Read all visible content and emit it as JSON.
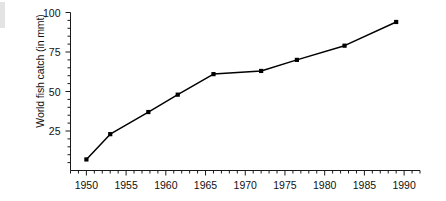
{
  "chart_data": {
    "type": "line",
    "title": "",
    "xlabel": "",
    "ylabel": "World fish catch (in mmt)",
    "xlim": [
      1948,
      1992
    ],
    "ylim": [
      0,
      100
    ],
    "grid": false,
    "legend": null,
    "x_major_ticks": [
      1950,
      1955,
      1960,
      1965,
      1970,
      1975,
      1980,
      1985,
      1990
    ],
    "x_tick_labels": [
      "1950",
      "1955",
      "1960",
      "1965",
      "1970",
      "1975",
      "1980",
      "1985",
      "1990"
    ],
    "x_minor_tick_interval": 1,
    "y_major_ticks": [
      25,
      50,
      75,
      100
    ],
    "y_tick_labels": [
      "25",
      "50",
      "75",
      "100"
    ],
    "y_minor_tick_interval": 5,
    "marker": "square",
    "marker_color": "#000000",
    "line_color": "#000000",
    "x": [
      1950,
      1953,
      1957.8,
      1961.5,
      1966,
      1972,
      1976.5,
      1982.5,
      1989
    ],
    "values": [
      7,
      23,
      37,
      48,
      61,
      63,
      70,
      79,
      94
    ],
    "points": [
      {
        "x": 1950,
        "y": 7
      },
      {
        "x": 1953,
        "y": 23
      },
      {
        "x": 1957.8,
        "y": 37
      },
      {
        "x": 1961.5,
        "y": 48
      },
      {
        "x": 1966,
        "y": 61
      },
      {
        "x": 1972,
        "y": 63
      },
      {
        "x": 1976.5,
        "y": 70
      },
      {
        "x": 1982.5,
        "y": 79
      },
      {
        "x": 1989,
        "y": 94
      }
    ]
  }
}
